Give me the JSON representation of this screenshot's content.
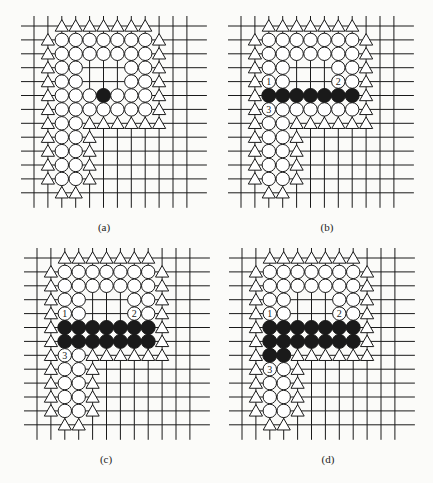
{
  "figure": {
    "grid": {
      "columns": 12,
      "rows": 13,
      "line_color": "#1a1a1a",
      "stone_white": "#ffffff",
      "stone_black": "#1a1a1a"
    },
    "legend": {
      "circle": "white stone",
      "filled_circle": "black stone",
      "triangle": "boundary marker",
      "labels": [
        "1",
        "2",
        "3"
      ]
    },
    "panels": [
      {
        "id": "a",
        "caption": "(a)",
        "origin": [
          34,
          26
        ],
        "caption_pos": [
          104,
          228
        ],
        "rows": [
          "..TTTTTTT...",
          ".TOOOOOOOT..",
          ".TOOOOOOOT..",
          ".TOO...OOT..",
          ".TOO...OOT..",
          ".TOOOXOOOT..",
          ".TOOOOOOOT..",
          ".TOOTTTTTT..",
          ".TOOT.......",
          ".TOOT.......",
          ".TOOT.......",
          ".TOOT.......",
          "..TT........"
        ]
      },
      {
        "id": "b",
        "caption": "(b)",
        "origin": [
          241,
          26
        ],
        "caption_pos": [
          327,
          228
        ],
        "rows": [
          "..TTTTTTT...",
          ".TOOOOOOOT..",
          ".TOOOOOOOT..",
          ".TOO...OOT..",
          ".T1O...2OT..",
          ".TXXXXXXXT..",
          ".T3OOOOOOT..",
          ".TOOTTTTTT..",
          ".TOOT.......",
          ".TOOT.......",
          ".TOOT.......",
          ".TOOT.......",
          "..TT........"
        ]
      },
      {
        "id": "c",
        "caption": "(c)",
        "origin": [
          37,
          258
        ],
        "caption_pos": [
          106,
          460
        ],
        "rows": [
          "..TTTTTTT...",
          ".TOOOOOOOT..",
          ".TOOOOOOOT..",
          ".TOO...OOT..",
          ".T1O...2OT..",
          ".TXXXXXXXT..",
          ".TXXXXXXXT..",
          ".T3OTTTTTT..",
          ".TOOT.......",
          ".TOOT.......",
          ".TOOT.......",
          ".TOOT.......",
          "..TT........"
        ]
      },
      {
        "id": "d",
        "caption": "(d)",
        "origin": [
          242,
          258
        ],
        "caption_pos": [
          328,
          460
        ],
        "rows": [
          "..TTTTTTT...",
          ".TOOOOOOOT..",
          ".TOOOOOOOT..",
          ".TOO...OOT..",
          ".T1O...2OT..",
          ".TXXXXXXXT..",
          ".TXXXXXXXT..",
          ".TXXTTTTTT..",
          ".T3OT.......",
          ".TOOT.......",
          ".TOOT.......",
          ".TOOT.......",
          "..TT........"
        ]
      }
    ]
  }
}
